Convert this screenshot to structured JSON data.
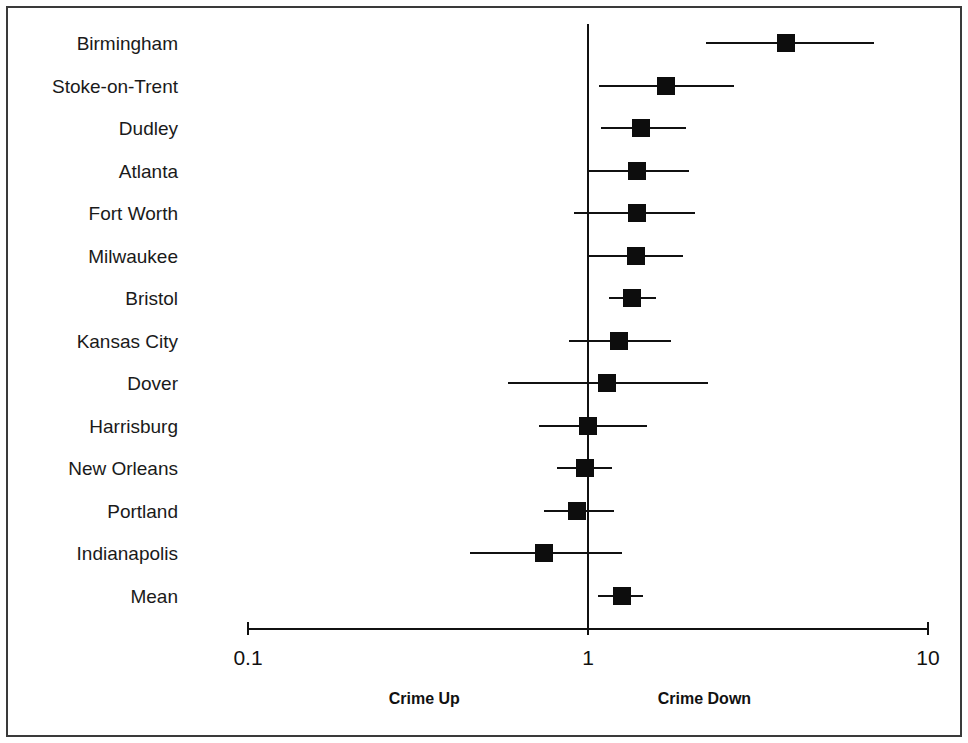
{
  "chart_data": {
    "type": "scatter",
    "subtype": "forest-plot",
    "title": "",
    "xlabel": "",
    "ylabel": "",
    "xscale": "log",
    "xlim": [
      0.1,
      10
    ],
    "xticks": [
      0.1,
      1,
      10
    ],
    "xtick_labels": [
      "0.1",
      "1",
      "10"
    ],
    "grid": false,
    "null_line": 1,
    "legend": null,
    "annotations": [
      {
        "text": "Crime Up",
        "x": 0.33,
        "position": "below-axis-left"
      },
      {
        "text": "Crime Down",
        "x": 2.2,
        "position": "below-axis-right"
      }
    ],
    "categories": [
      "Birmingham",
      "Stoke-on-Trent",
      "Dudley",
      "Atlanta",
      "Fort Worth",
      "Milwaukee",
      "Bristol",
      "Kansas City",
      "Dover",
      "Harrisburg",
      "New Orleans",
      "Portland",
      "Indianapolis",
      "Mean"
    ],
    "series": [
      {
        "name": "Odds ratio (point estimate with 95% confidence interval)",
        "values": [
          3.83,
          1.7,
          1.43,
          1.39,
          1.39,
          1.38,
          1.35,
          1.23,
          1.14,
          1.0,
          0.98,
          0.93,
          0.74,
          1.26
        ],
        "ci_low": [
          2.22,
          1.08,
          1.09,
          1.0,
          0.91,
          1.0,
          1.15,
          0.88,
          0.58,
          0.72,
          0.81,
          0.74,
          0.45,
          1.07
        ],
        "ci_high": [
          6.95,
          2.68,
          1.94,
          1.98,
          2.07,
          1.9,
          1.58,
          1.76,
          2.25,
          1.49,
          1.18,
          1.19,
          1.26,
          1.45
        ]
      }
    ],
    "points": [
      {
        "label": "Birmingham",
        "value": 3.83,
        "ci_low": 2.22,
        "ci_high": 6.95
      },
      {
        "label": "Stoke-on-Trent",
        "value": 1.7,
        "ci_low": 1.08,
        "ci_high": 2.68
      },
      {
        "label": "Dudley",
        "value": 1.43,
        "ci_low": 1.09,
        "ci_high": 1.94
      },
      {
        "label": "Atlanta",
        "value": 1.39,
        "ci_low": 1.0,
        "ci_high": 1.98
      },
      {
        "label": "Fort Worth",
        "value": 1.39,
        "ci_low": 0.91,
        "ci_high": 2.07
      },
      {
        "label": "Milwaukee",
        "value": 1.38,
        "ci_low": 1.0,
        "ci_high": 1.9
      },
      {
        "label": "Bristol",
        "value": 1.35,
        "ci_low": 1.15,
        "ci_high": 1.58
      },
      {
        "label": "Kansas City",
        "value": 1.23,
        "ci_low": 0.88,
        "ci_high": 1.76
      },
      {
        "label": "Dover",
        "value": 1.14,
        "ci_low": 0.58,
        "ci_high": 2.25
      },
      {
        "label": "Harrisburg",
        "value": 1.0,
        "ci_low": 0.72,
        "ci_high": 1.49
      },
      {
        "label": "New Orleans",
        "value": 0.98,
        "ci_low": 0.81,
        "ci_high": 1.18
      },
      {
        "label": "Portland",
        "value": 0.93,
        "ci_low": 0.74,
        "ci_high": 1.19
      },
      {
        "label": "Indianapolis",
        "value": 0.74,
        "ci_low": 0.45,
        "ci_high": 1.26
      },
      {
        "label": "Mean",
        "value": 1.26,
        "ci_low": 1.07,
        "ci_high": 1.45
      }
    ]
  },
  "axis": {
    "tick_labels": [
      "0.1",
      "1",
      "10"
    ],
    "left_direction_label": "Crime Up",
    "right_direction_label": "Crime Down"
  },
  "colors": {
    "marker": "#0d0d0d",
    "line": "#111111",
    "frame": "#3a3a3a",
    "background": "#ffffff",
    "text": "#1a1a1a"
  }
}
